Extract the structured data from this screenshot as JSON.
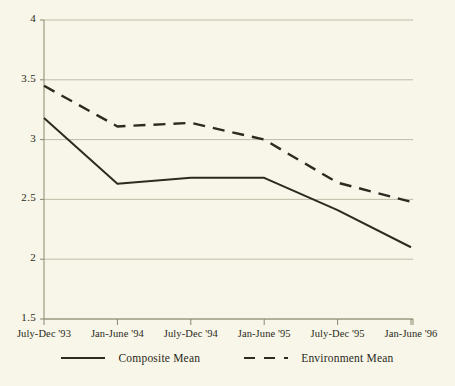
{
  "chart_data": {
    "type": "line",
    "title": "",
    "xlabel": "",
    "ylabel": "",
    "categories": [
      "July-Dec '93",
      "Jan-June '94",
      "July-Dec '94",
      "Jan-June '95",
      "July-Dec '95",
      "Jan-June '96"
    ],
    "series": [
      {
        "name": "Composite Mean",
        "style": "solid",
        "color": "#2b2b20",
        "values": [
          3.18,
          2.63,
          2.68,
          2.68,
          2.41,
          2.1
        ]
      },
      {
        "name": "Environment Mean",
        "style": "dashed",
        "color": "#2b2b20",
        "values": [
          3.45,
          3.11,
          3.14,
          3.0,
          2.64,
          2.48
        ]
      }
    ],
    "ylim": [
      1.5,
      4
    ],
    "yticks": [
      "1.5",
      "2",
      "2.5",
      "3",
      "3.5",
      "4"
    ],
    "ytick_values": [
      1.5,
      2,
      2.5,
      3,
      3.5,
      4
    ],
    "grid": true,
    "legend_position": "bottom",
    "background_color": "#f8f6e8",
    "grid_color": "#b8b5a0",
    "axis_color": "#8a8770"
  },
  "legend": {
    "entries": [
      {
        "label": "Composite Mean",
        "style": "solid"
      },
      {
        "label": "Environment Mean",
        "style": "dashed"
      }
    ]
  }
}
